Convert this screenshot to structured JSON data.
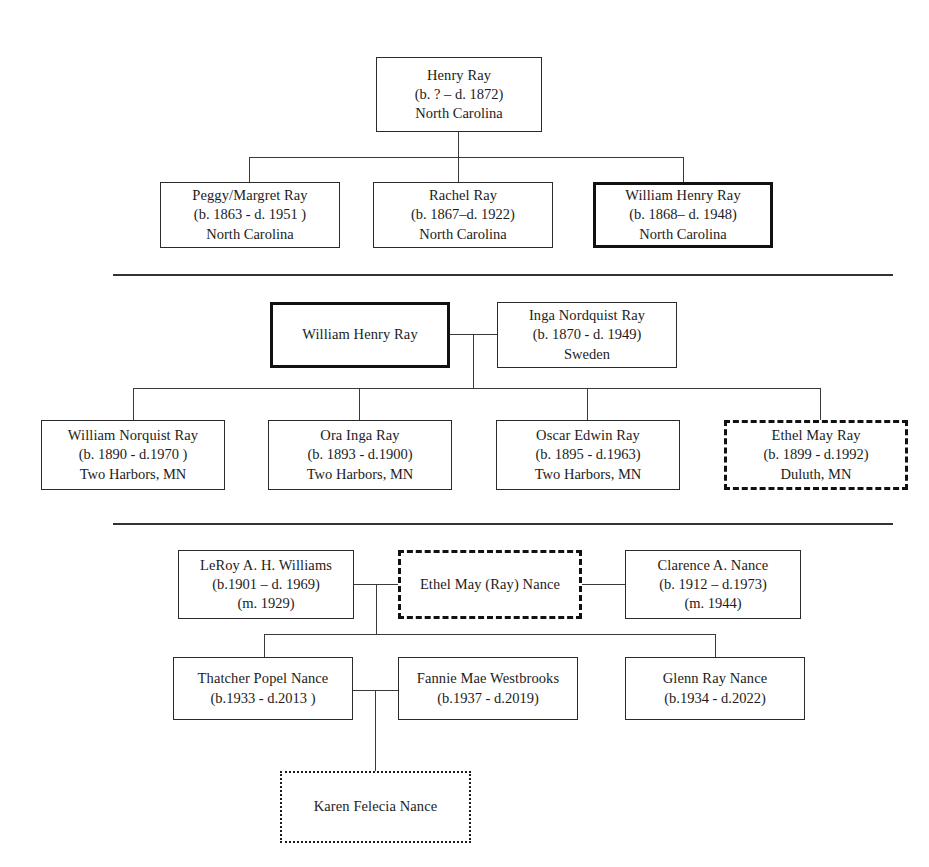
{
  "generations": [
    {
      "id": "gen0",
      "label": "Generation 0",
      "nodes": [
        {
          "id": "henry-ray",
          "name": "Henry Ray",
          "dates": "(b. ? – d. 1872)",
          "place": "North Carolina",
          "border": "solid"
        }
      ]
    },
    {
      "id": "gen1",
      "label": "Generation 1",
      "nodes": [
        {
          "id": "peggy-margret-ray",
          "name": "Peggy/Margret Ray",
          "dates": "(b. 1863 -  d. 1951 )",
          "place": "North Carolina",
          "border": "solid"
        },
        {
          "id": "rachel-ray",
          "name": "Rachel Ray",
          "dates": "(b. 1867–d. 1922)",
          "place": "North Carolina",
          "border": "solid"
        },
        {
          "id": "william-henry-ray",
          "name": "William Henry Ray",
          "dates": "(b. 1868– d. 1948)",
          "place": "North Carolina",
          "border": "thick"
        }
      ]
    },
    {
      "id": "gen2-parents",
      "label": "Generation 2 parents",
      "nodes": [
        {
          "id": "william-henry-ray-repeat",
          "name": "William Henry Ray",
          "dates": "",
          "place": "",
          "border": "thick"
        },
        {
          "id": "inga-nordquist-ray",
          "name": "Inga Nordquist Ray",
          "dates": "(b. 1870 - d. 1949)",
          "place": "Sweden",
          "border": "solid"
        }
      ]
    },
    {
      "id": "gen2-children",
      "label": "Generation 2 children",
      "nodes": [
        {
          "id": "william-norquist-ray",
          "name": "William Norquist Ray",
          "dates": "(b. 1890 - d.1970 )",
          "place": "Two Harbors, MN",
          "border": "solid"
        },
        {
          "id": "ora-inga-ray",
          "name": "Ora Inga Ray",
          "dates": "(b. 1893 - d.1900)",
          "place": "Two Harbors, MN",
          "border": "solid"
        },
        {
          "id": "oscar-edwin-ray",
          "name": "Oscar Edwin Ray",
          "dates": "(b. 1895 - d.1963)",
          "place": "Two Harbors, MN",
          "border": "solid"
        },
        {
          "id": "ethel-may-ray",
          "name": "Ethel May Ray",
          "dates": "(b. 1899 - d.1992)",
          "place": "Duluth, MN",
          "border": "dashed"
        }
      ]
    },
    {
      "id": "gen3-parents",
      "label": "Generation 3 parents",
      "nodes": [
        {
          "id": "leroy-williams",
          "name": "LeRoy A. H. Williams",
          "dates": "(b.1901 – d. 1969)",
          "place": "(m. 1929)",
          "border": "solid"
        },
        {
          "id": "ethel-may-ray-nance",
          "name": "Ethel May (Ray) Nance",
          "dates": "",
          "place": "",
          "border": "dashed"
        },
        {
          "id": "clarence-nance",
          "name": "Clarence A. Nance",
          "dates": "(b. 1912 – d.1973)",
          "place": "(m. 1944)",
          "border": "solid"
        }
      ]
    },
    {
      "id": "gen3-children",
      "label": "Generation 3 children",
      "nodes": [
        {
          "id": "thatcher-popel-nance",
          "name": "Thatcher Popel Nance",
          "dates": "(b.1933  - d.2013 )",
          "place": "",
          "border": "solid"
        },
        {
          "id": "fannie-mae-westbrooks",
          "name": "Fannie Mae Westbrooks",
          "dates": "(b.1937 - d.2019)",
          "place": "",
          "border": "solid"
        },
        {
          "id": "glenn-ray-nance",
          "name": "Glenn Ray Nance",
          "dates": "(b.1934  - d.2022)",
          "place": "",
          "border": "solid"
        }
      ]
    },
    {
      "id": "gen4",
      "label": "Generation 4",
      "nodes": [
        {
          "id": "karen-felecia-nance",
          "name": "Karen Felecia Nance",
          "dates": "",
          "place": "",
          "border": "dotted"
        }
      ]
    }
  ]
}
